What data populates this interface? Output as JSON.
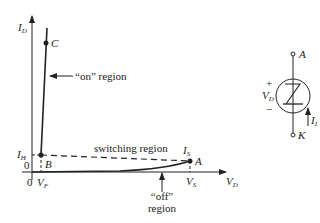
{
  "figure": {
    "axes": {
      "y_label": "I",
      "y_label_sub": "D",
      "x_label": "V",
      "x_label_sub": "D",
      "origin_x_label": "0",
      "origin_y_label": "0"
    },
    "points": {
      "C": "C",
      "B": "B",
      "A": "A"
    },
    "ticks": {
      "ih": "I",
      "ih_sub": "H",
      "vf": "V",
      "vf_sub": "F",
      "is": "I",
      "is_sub": "S",
      "vs": "V",
      "vs_sub": "S"
    },
    "annotations": {
      "on_region": "“on” region",
      "switching_region": "switching region",
      "off_region_line1": "“off”",
      "off_region_line2": "region"
    },
    "symbol": {
      "anode": "A",
      "cathode": "K",
      "plus": "+",
      "minus": "−",
      "voltage": "V",
      "voltage_sub": "D",
      "current": "I",
      "current_sub": "I"
    }
  }
}
